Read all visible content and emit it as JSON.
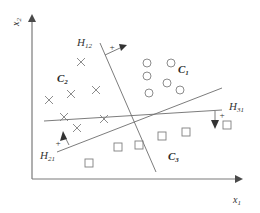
{
  "diagram": {
    "title": "",
    "axes": {
      "x_label": "x",
      "x_sub": "1",
      "y_label": "x",
      "y_sub": "2"
    },
    "hyperplanes": [
      {
        "id": "H12",
        "label": "H",
        "sub": "12",
        "direction_marker": "+"
      },
      {
        "id": "H31",
        "label": "H",
        "sub": "31",
        "direction_marker": "+"
      },
      {
        "id": "H21",
        "label": "H",
        "sub": "21",
        "direction_marker": "+"
      }
    ],
    "classes": [
      {
        "id": "C1",
        "label": "C",
        "sub": "1",
        "marker": "circle"
      },
      {
        "id": "C2",
        "label": "C",
        "sub": "2",
        "marker": "cross"
      },
      {
        "id": "C3",
        "label": "C",
        "sub": "3",
        "marker": "square"
      }
    ],
    "points": {
      "C1_circles": [
        [
          147,
          63
        ],
        [
          171,
          63
        ],
        [
          147,
          76
        ],
        [
          167,
          83
        ],
        [
          149,
          93
        ],
        [
          180,
          90
        ]
      ],
      "C2_crosses": [
        [
          81,
          62
        ],
        [
          49,
          100
        ],
        [
          71,
          94
        ],
        [
          96,
          90
        ],
        [
          104,
          119
        ],
        [
          64,
          117
        ],
        [
          77,
          128
        ]
      ],
      "C3_squares": [
        [
          218,
          124
        ],
        [
          186,
          132
        ],
        [
          162,
          142
        ],
        [
          139,
          150
        ],
        [
          89,
          163
        ]
      ]
    },
    "colors": {
      "line": "#6d6d6d",
      "marker": "#7f7f7f",
      "text": "#333333"
    }
  }
}
